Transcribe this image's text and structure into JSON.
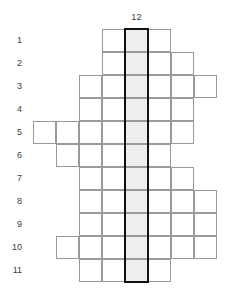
{
  "puzzle": {
    "column_label": "12",
    "row_labels": [
      "1",
      "2",
      "3",
      "4",
      "5",
      "6",
      "7",
      "8",
      "9",
      "10",
      "11"
    ],
    "colors": {
      "cell_border": "#9a9a9a",
      "cell_fill": "#ffffff",
      "highlight_fill": "#eeeeee",
      "highlight_outline": "#111111",
      "label_text": "#3c3c3c",
      "background": "#ffffff"
    },
    "geometry": {
      "cell_size": 23,
      "grid_origin_x": 33,
      "grid_origin_y": 29,
      "columns": 8,
      "rows": 11,
      "highlight_column": 5
    },
    "rows": [
      {
        "label": "1",
        "start_col": 4,
        "end_col": 6
      },
      {
        "label": "2",
        "start_col": 4,
        "end_col": 7
      },
      {
        "label": "3",
        "start_col": 3,
        "end_col": 8
      },
      {
        "label": "4",
        "start_col": 3,
        "end_col": 7
      },
      {
        "label": "5",
        "start_col": 1,
        "end_col": 7
      },
      {
        "label": "6",
        "start_col": 2,
        "end_col": 6
      },
      {
        "label": "7",
        "start_col": 3,
        "end_col": 7
      },
      {
        "label": "8",
        "start_col": 3,
        "end_col": 8
      },
      {
        "label": "9",
        "start_col": 3,
        "end_col": 8
      },
      {
        "label": "10",
        "start_col": 2,
        "end_col": 8
      },
      {
        "label": "11",
        "start_col": 3,
        "end_col": 6
      }
    ]
  }
}
